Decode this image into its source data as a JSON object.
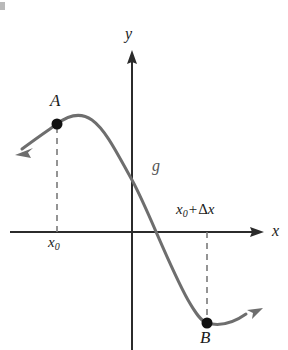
{
  "figure": {
    "background_color": "#ffffff",
    "width": 288,
    "height": 350
  },
  "axes": {
    "x_axis": {
      "label": "x",
      "color": "#2b2b2b",
      "y_position": 232,
      "x_start": 10,
      "x_end": 265,
      "label_x": 274,
      "label_y": 233
    },
    "y_axis": {
      "label": "y",
      "color": "#2b2b2b",
      "x_position": 132,
      "y_start": 50,
      "y_end": 350,
      "label_x": 127,
      "label_y": 30
    }
  },
  "curve": {
    "name": "g",
    "label": "g",
    "label_x": 152,
    "label_y": 160,
    "color": "#6e6e6e",
    "stroke_width": 3,
    "path": "M 22 149 C 38 137 50 129 57 124 C 70 114 82 113 92 120 C 106 130 118 155 132 180 C 148 209 168 264 188 300 C 196 314 201 321 207 323 C 218 326 232 324 246 314",
    "left_arrow_tip_x": 16,
    "left_arrow_tip_y": 154,
    "right_arrow_tip_x": 262,
    "right_arrow_tip_y": 309
  },
  "points": [
    {
      "id": "A",
      "label": "A",
      "x": 57,
      "y": 124,
      "radius": 5.5,
      "color": "#111111",
      "label_x": 50,
      "label_y": 96,
      "drop_line_to_y": 232
    },
    {
      "id": "B",
      "label": "B",
      "x": 207,
      "y": 323,
      "radius": 5.5,
      "color": "#111111",
      "label_x": 201,
      "label_y": 332,
      "drop_line_to_y": 232
    }
  ],
  "tick_labels": [
    {
      "id": "x0",
      "base": "x",
      "sub": "0",
      "x": 48,
      "y": 237,
      "anchor": "below-axis"
    },
    {
      "id": "x0-plus-delta-x",
      "base": "x",
      "sub": "0",
      "operator": "+",
      "delta": "Δ",
      "var": "x",
      "x": 176,
      "y": 203,
      "anchor": "above-axis"
    }
  ],
  "dashed_lines": {
    "color": "#7a7a7a",
    "stroke_width": 1.6,
    "dash_pattern": "6,5",
    "lines": [
      {
        "name": "dashed-line-a",
        "x": 57,
        "y1": 127,
        "y2": 232
      },
      {
        "name": "dashed-line-b",
        "x": 207,
        "y1": 232,
        "y2": 320
      }
    ]
  },
  "colors": {
    "curve": "#6e6e6e",
    "axis": "#2b2b2b",
    "dash": "#7a7a7a",
    "point": "#111111",
    "text": "#1a1a1a",
    "function_label": "#555555"
  }
}
